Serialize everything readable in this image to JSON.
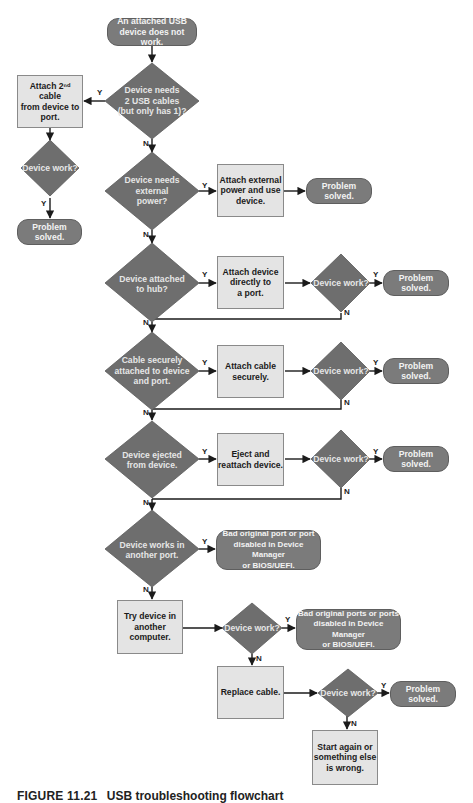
{
  "diagram": {
    "type": "flowchart",
    "colors": {
      "terminator_fill": "#7b7b7b",
      "decision_fill": "#6e6e6e",
      "process_fill": "#e4e4e4",
      "line": "#1b1b1b",
      "background": "#ffffff"
    },
    "start": {
      "text": "An attached USB\ndevice does not work."
    },
    "decisions": [
      {
        "id": "d1",
        "text": "Device needs\n2 USB cables\n(but only has 1)?"
      },
      {
        "id": "d2",
        "text": "Device needs\nexternal\npower?"
      },
      {
        "id": "d3",
        "text": "Device attached\nto hub?"
      },
      {
        "id": "d4",
        "text": "Cable securely\nattached to device\nand port."
      },
      {
        "id": "d5",
        "text": "Device ejected\nfrom device."
      },
      {
        "id": "d6",
        "text": "Device works in\nanother port."
      }
    ],
    "checks": [
      {
        "id": "c_left",
        "text": "Device work?"
      },
      {
        "id": "c3",
        "text": "Device work?"
      },
      {
        "id": "c4",
        "text": "Device work?"
      },
      {
        "id": "c5",
        "text": "Device work?"
      },
      {
        "id": "c7",
        "text": "Device work?"
      },
      {
        "id": "c8",
        "text": "Device work?"
      }
    ],
    "processes": [
      {
        "id": "p1",
        "text": "Attach 2ⁿᵈ cable\nfrom device to\nport."
      },
      {
        "id": "p2",
        "text": "Attach external\npower and use\ndevice."
      },
      {
        "id": "p3",
        "text": "Attach device\ndirectly to\na port."
      },
      {
        "id": "p4",
        "text": "Attach cable\nsecurely."
      },
      {
        "id": "p5",
        "text": "Eject and\nreattach device."
      },
      {
        "id": "p7",
        "text": "Try device in\nanother\ncomputer."
      },
      {
        "id": "p8",
        "text": "Replace cable."
      },
      {
        "id": "p9",
        "text": "Start again or\nsomething else\nis wrong."
      }
    ],
    "outcomes": [
      {
        "id": "o_left",
        "text": "Problem solved."
      },
      {
        "id": "o2",
        "text": "Problem solved."
      },
      {
        "id": "o3",
        "text": "Problem solved."
      },
      {
        "id": "o4",
        "text": "Problem solved."
      },
      {
        "id": "o5",
        "text": "Problem solved."
      },
      {
        "id": "o6",
        "text": "Bad original port or port\ndisabled in Device Manager\nor BIOS/UEFI."
      },
      {
        "id": "o7",
        "text": "Bad original ports or ports\ndisabled in Device Manager\nor BIOS/UEFI."
      },
      {
        "id": "o8",
        "text": "Problem solved."
      }
    ],
    "edge_labels": {
      "yes": "Y",
      "no": "N"
    },
    "caption": {
      "figure": "FIGURE 11.21",
      "title": "USB troubleshooting flowchart"
    }
  }
}
